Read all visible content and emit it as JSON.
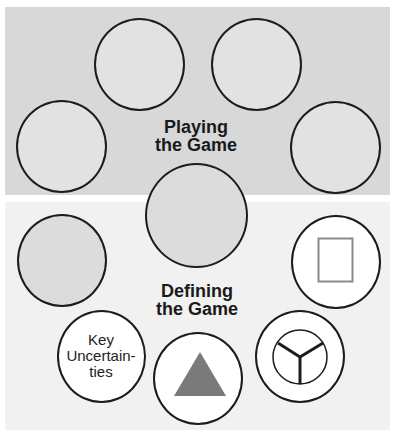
{
  "sections": {
    "playing": {
      "title_line1": "Playing",
      "title_line2": "the Game",
      "background": "#d8d8d8"
    },
    "defining": {
      "title_line1": "Defining",
      "title_line2": "the Game",
      "background": "#f1f1f1"
    }
  },
  "nodes": {
    "key_uncertainties": {
      "line1": "Key",
      "line2": "Uncertain-",
      "line3": "ties"
    }
  },
  "icons": {
    "rectangle": "rectangle-icon",
    "triangle": "triangle-icon",
    "y_circle": "y-in-circle-icon"
  },
  "colors": {
    "outline": "#1c1c1c",
    "icon_gray": "#7a7a7a",
    "rect_stroke": "#8a8a8a"
  }
}
